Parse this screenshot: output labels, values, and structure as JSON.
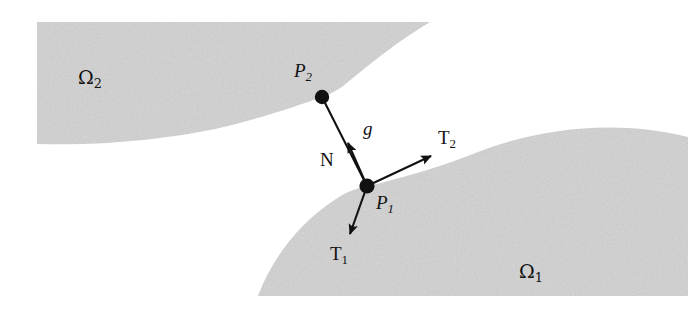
{
  "figure": {
    "type": "geometric-contact-diagram",
    "width": 688,
    "height": 311,
    "background_color": "#ffffff",
    "region_fill_color": "#d2d2d2",
    "stroke_color": "#111111"
  },
  "regions": [
    {
      "id": "omega2",
      "label": "Ω",
      "subscript": "2",
      "position": "upper-left",
      "description": "shaded body occupying the upper-left, boundary curving down-right to point P2"
    },
    {
      "id": "omega1",
      "label": "Ω",
      "subscript": "1",
      "position": "lower-right",
      "description": "shaded body occupying the lower-right, boundary curving up-right through point P1"
    }
  ],
  "points": [
    {
      "id": "p2",
      "label": "P",
      "subscript": "2",
      "x": 322,
      "y": 97,
      "on_region": "omega2"
    },
    {
      "id": "p1",
      "label": "P",
      "subscript": "1",
      "x": 367,
      "y": 186,
      "on_region": "omega1"
    }
  ],
  "segments": [
    {
      "id": "gap",
      "label": "g",
      "from": "p1",
      "to": "p2",
      "description": "gap distance segment joining P1 and P2"
    }
  ],
  "vectors": [
    {
      "id": "normal",
      "label": "N",
      "subscript": "",
      "from_x": 367,
      "from_y": 186,
      "to_x": 347,
      "to_y": 141,
      "description": "unit normal at P1 directed toward P2"
    },
    {
      "id": "tangent2",
      "label": "T",
      "subscript": "2",
      "from_x": 367,
      "from_y": 186,
      "to_x": 433,
      "to_y": 155,
      "description": "tangent vector at P1 pointing up-right along the omega1 boundary"
    },
    {
      "id": "tangent1",
      "label": "T",
      "subscript": "1",
      "from_x": 367,
      "from_y": 186,
      "to_x": 349,
      "to_y": 237,
      "description": "tangent vector at P1 pointing down-left into the omega1 boundary"
    }
  ]
}
